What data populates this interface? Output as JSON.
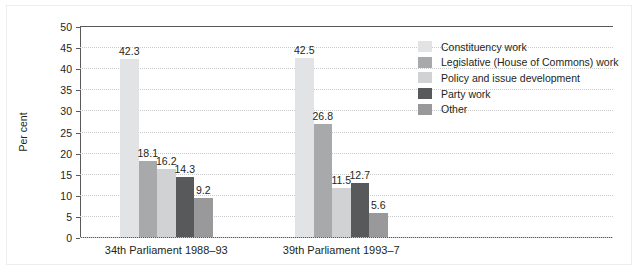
{
  "chart_data": {
    "type": "bar",
    "title": "",
    "xlabel": "",
    "ylabel": "Per cent",
    "ylim": [
      0,
      50
    ],
    "ytick_step": 5,
    "yticks": [
      "0",
      "5",
      "10",
      "15",
      "20",
      "25",
      "30",
      "35",
      "40",
      "45",
      "50"
    ],
    "grid": true,
    "legend_position": "right",
    "categories": [
      "34th Parliament 1988–93",
      "39th Parliament 1993–7"
    ],
    "series": [
      {
        "name": "Constituency work",
        "color": "#e2e3e4",
        "values": [
          42.3,
          42.5
        ]
      },
      {
        "name": "Legislative (House of Commons) work",
        "color": "#a7a9ab",
        "values": [
          18.1,
          26.8
        ]
      },
      {
        "name": "Policy and issue development",
        "color": "#d0d2d3",
        "values": [
          16.2,
          11.5
        ]
      },
      {
        "name": "Party work",
        "color": "#58595b",
        "values": [
          14.3,
          12.7
        ]
      },
      {
        "name": "Other",
        "color": "#99999b",
        "values": [
          9.2,
          5.6
        ]
      }
    ],
    "value_labels": [
      [
        "42.3",
        "18.1",
        "16.2",
        "14.3",
        "9.2"
      ],
      [
        "42.5",
        "26.8",
        "11.5",
        "12.7",
        "5.6"
      ]
    ]
  }
}
